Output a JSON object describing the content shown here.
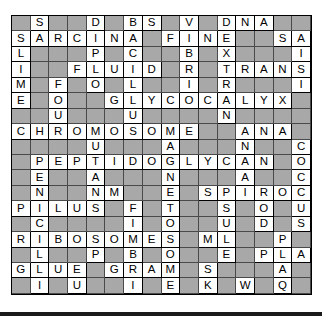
{
  "puzzle": {
    "title": "Microbiology Crossword Puzzle",
    "rows": 18,
    "columns": 16,
    "colors": {
      "blank_cell": "#a8a8a8",
      "letter_cell": "#ffffff",
      "letter_text": "#000000",
      "grid_line": "#000000",
      "bottom_bar": "#1a1a1a"
    },
    "grid": [
      [
        "",
        "S",
        "",
        "",
        "D",
        "",
        "B",
        "S",
        "",
        "V",
        "",
        "D",
        "N",
        "A",
        "",
        ""
      ],
      [
        "S",
        "A",
        "R",
        "C",
        "I",
        "N",
        "A",
        "",
        "F",
        "I",
        "N",
        "E",
        "",
        "",
        "S",
        "A"
      ],
      [
        "L",
        "",
        "",
        "",
        "P",
        "",
        "C",
        "",
        "",
        "B",
        "",
        "X",
        "",
        "",
        "",
        "I"
      ],
      [
        "I",
        "",
        "",
        "F",
        "L",
        "U",
        "I",
        "D",
        "",
        "R",
        "",
        "T",
        "R",
        "A",
        "N",
        "S"
      ],
      [
        "M",
        "",
        "F",
        "",
        "O",
        "",
        "L",
        "",
        "",
        "I",
        "",
        "R",
        "",
        "",
        "",
        "I"
      ],
      [
        "E",
        "",
        "O",
        "",
        "",
        "G",
        "L",
        "Y",
        "C",
        "O",
        "C",
        "A",
        "L",
        "Y",
        "X",
        ""
      ],
      [
        "",
        "",
        "U",
        "",
        "",
        "",
        "U",
        "",
        "",
        "",
        "",
        "N",
        "",
        "",
        "",
        ""
      ],
      [
        "C",
        "H",
        "R",
        "O",
        "M",
        "O",
        "S",
        "O",
        "M",
        "E",
        "",
        "",
        "A",
        "N",
        "A",
        ""
      ],
      [
        "",
        "",
        "",
        "",
        "U",
        "",
        "",
        "",
        "A",
        "",
        "",
        "",
        "N",
        "",
        "",
        "C"
      ],
      [
        "",
        "P",
        "E",
        "P",
        "T",
        "I",
        "D",
        "O",
        "G",
        "L",
        "Y",
        "C",
        "A",
        "N",
        "",
        "O"
      ],
      [
        "",
        "E",
        "",
        "",
        "A",
        "",
        "",
        "",
        "N",
        "",
        "",
        "",
        "A",
        "",
        "",
        "C"
      ],
      [
        "",
        "N",
        "",
        "",
        "N",
        "M",
        "",
        "",
        "E",
        "",
        "S",
        "P",
        "I",
        "R",
        "O",
        "C"
      ],
      [
        "P",
        "I",
        "L",
        "U",
        "S",
        "",
        "F",
        "",
        "T",
        "",
        "",
        "S",
        "",
        "O",
        "",
        "U"
      ],
      [
        "",
        "C",
        "",
        "",
        "",
        "",
        "I",
        "",
        "O",
        "",
        "",
        "U",
        "",
        "D",
        "",
        "S"
      ],
      [
        "R",
        "I",
        "B",
        "O",
        "S",
        "O",
        "M",
        "E",
        "S",
        "",
        "M",
        "L",
        "",
        "",
        "P",
        ""
      ],
      [
        "",
        "L",
        "",
        "",
        "P",
        "",
        "B",
        "",
        "O",
        "",
        "",
        "E",
        "",
        "P",
        "L",
        "A"
      ],
      [
        "G",
        "L",
        "U",
        "E",
        "",
        "G",
        "R",
        "A",
        "M",
        "",
        "S",
        "",
        "",
        "",
        "A",
        ""
      ],
      [
        "",
        "I",
        "",
        "U",
        "",
        "",
        "I",
        "",
        "E",
        "",
        "K",
        "",
        "W",
        "",
        "Q",
        ""
      ]
    ]
  }
}
